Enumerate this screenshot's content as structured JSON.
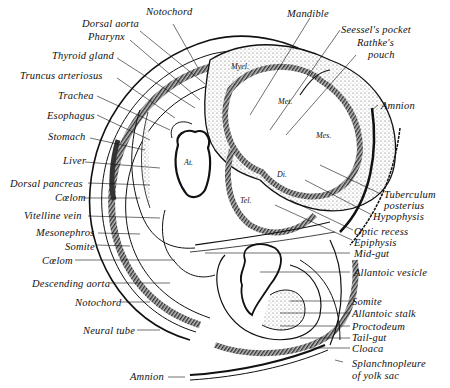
{
  "figure": {
    "type": "embryo sagittal section diagram",
    "colors": {
      "ink": "#111111",
      "background": "#ffffff",
      "stipple": "#9a9a9a",
      "muscle_band": "#555555"
    }
  },
  "labels": {
    "left": [
      "Notochord",
      "Dorsal aorta",
      "Pharynx",
      "Thyroid gland",
      "Truncus arteriosus",
      "Trachea",
      "Esophagus",
      "Stomach",
      "Liver",
      "Dorsal pancreas",
      "Cœlom",
      "Vitelline vein",
      "Mesonephros",
      "Somite",
      "Cœlom",
      "Descending aorta",
      "Notochord",
      "Neural tube",
      "Amnion"
    ],
    "top_right": [
      "Mandible",
      "Seessel's pocket",
      "Rathke's",
      "pouch",
      "Amnion"
    ],
    "right": [
      "Tuberculum",
      "posterius",
      "Hypophysis",
      "Optic recess",
      "Epiphysis",
      "Mid-gut",
      "Allantoic vesicle",
      "Somite",
      "Allantoic stalk",
      "Proctodeum",
      "Tail-gut",
      "Cloaca",
      "Splanchnopleure",
      "of yolk sac"
    ],
    "inner": [
      "Myel.",
      "Met.",
      "Mes.",
      "Di.",
      "Tel.",
      "At.",
      "ven."
    ]
  }
}
